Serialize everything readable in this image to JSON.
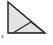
{
  "figure": {
    "background_color": "#ffffff",
    "fill_color": "#e3e3e3",
    "stroke_color": "#1a1a1a",
    "inner_stroke_color": "#2b2b2b",
    "stroke_width": 1.4,
    "inner_stroke_width": 1.2,
    "corner_label": "s",
    "vertices": {
      "top_left": [
        8,
        2
      ],
      "bottom_left": [
        8,
        33
      ],
      "bottom_right": [
        45,
        33
      ]
    },
    "inner_segment": {
      "from": [
        13,
        33
      ],
      "to": [
        31,
        22
      ]
    },
    "inner_segment_2": {
      "from": [
        31,
        22
      ],
      "to": [
        45,
        33
      ]
    }
  },
  "chart_data": {
    "type": "diagram",
    "shapes": [
      {
        "name": "outer-triangle",
        "kind": "polygon",
        "points": [
          [
            8,
            2
          ],
          [
            8,
            33
          ],
          [
            45,
            33
          ]
        ],
        "fill": "#e3e3e3",
        "stroke": "#1a1a1a"
      },
      {
        "name": "internal-segment",
        "kind": "polyline",
        "points": [
          [
            13,
            33
          ],
          [
            31,
            22
          ],
          [
            45,
            33
          ]
        ],
        "fill": "none",
        "stroke": "#2b2b2b"
      }
    ],
    "labels": [
      {
        "text": "s",
        "x": 3,
        "y": 38
      }
    ],
    "xlim": [
      0,
      53
    ],
    "ylim": [
      0,
      45
    ]
  }
}
